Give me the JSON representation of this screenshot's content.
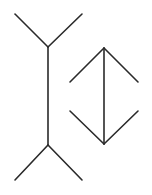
{
  "diagram": {
    "stroke_color": "#2a2a2a",
    "background_color": "#ffffff",
    "figures": [
      {
        "name": "fins-out",
        "description": "vertical shaft with outward-pointing fins at both ends"
      },
      {
        "name": "fins-in",
        "description": "vertical shaft with inward-pointing arrowheads at both ends"
      }
    ]
  }
}
